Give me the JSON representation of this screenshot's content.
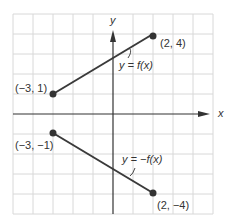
{
  "axes": {
    "x_label": "x",
    "y_label": "y"
  },
  "grid": {
    "unit_px": 20,
    "origin_px": [
      113,
      114
    ],
    "x_range": [
      -5,
      5
    ],
    "y_range": [
      -5,
      5
    ]
  },
  "colors": {
    "grid": "#d8d8d8",
    "axis": "#333333",
    "line": "#3a3a3a",
    "point": "#333333"
  },
  "segments": [
    {
      "name": "f",
      "label": "y = f(x)",
      "start": {
        "x": -3,
        "y": 1,
        "label": "(−3,  1)"
      },
      "end": {
        "x": 2,
        "y": 4,
        "label": "(2, 4)"
      }
    },
    {
      "name": "neg-f",
      "label": "y = −f(x)",
      "start": {
        "x": -3,
        "y": -1,
        "label": "(−3, −1)"
      },
      "end": {
        "x": 2,
        "y": -4,
        "label": "(2,  −4)"
      }
    }
  ]
}
